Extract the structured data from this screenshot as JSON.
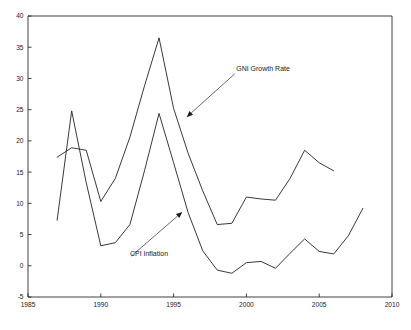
{
  "chart_data": {
    "type": "line",
    "title": "",
    "subtitle": "",
    "xlabel": "",
    "ylabel": "",
    "xlim": [
      1985,
      2010
    ],
    "ylim": [
      -5,
      40
    ],
    "xticks": [
      1985,
      1990,
      1995,
      2000,
      2005,
      2010
    ],
    "xtick_labels": [
      "1985",
      "1990",
      "1995",
      "2000",
      "2005",
      "2010"
    ],
    "yticks": [
      -5,
      0,
      5,
      10,
      15,
      20,
      25,
      30,
      35,
      40
    ],
    "ytick_labels": [
      "-5",
      "0",
      "5",
      "10",
      "15",
      "20",
      "25",
      "30",
      "35",
      "40"
    ],
    "grid": false,
    "legend": "none",
    "legend_position": "annotations-inline",
    "line_color": "#2e2e2e",
    "background_color": "#ffffff",
    "axis_color": "#2b2b2b",
    "series": [
      {
        "name": "GNI Growth Rate",
        "x": [
          1987,
          1988,
          1989,
          1990,
          1991,
          1992,
          1993,
          1994,
          1995,
          1996,
          1997,
          1998,
          1999,
          2000,
          2001,
          2002,
          2003,
          2004,
          2005,
          2006
        ],
        "values": [
          17.4,
          18.9,
          18.5,
          10.3,
          14.0,
          20.6,
          28.8,
          36.5,
          25.2,
          18.0,
          12.0,
          6.6,
          6.8,
          11.0,
          10.7,
          10.5,
          14.0,
          18.5,
          16.5,
          15.2
        ]
      },
      {
        "name": "CPI Inflation",
        "x": [
          1987,
          1988,
          1989,
          1990,
          1991,
          1992,
          1993,
          1994,
          1995,
          1996,
          1997,
          1998,
          1999,
          2000,
          2001,
          2002,
          2003,
          2004,
          2005,
          2006,
          2007,
          2008
        ],
        "values": [
          7.3,
          24.8,
          13.3,
          3.2,
          3.7,
          6.6,
          15.2,
          24.4,
          16.5,
          8.5,
          2.4,
          -0.7,
          -1.2,
          0.5,
          0.7,
          -0.4,
          2.0,
          4.3,
          2.3,
          1.9,
          4.8,
          9.2
        ]
      }
    ],
    "annotations": [
      {
        "id": "gni-annotation",
        "label": "GNI Growth Rate",
        "text_x": 1999.3,
        "text_y": 31.2,
        "point_x": 1995.9,
        "point_y": 23.8
      },
      {
        "id": "cpi-annotation",
        "label": "CPI Inflation",
        "text_x": 1992.0,
        "text_y": 1.6,
        "point_x": 1995.6,
        "point_y": 8.6
      }
    ]
  }
}
